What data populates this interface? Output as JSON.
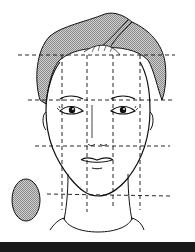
{
  "illustration": {
    "subject": "face proportion guide with turban",
    "colors": {
      "line": "#111111",
      "hatch": "#b5b5b5",
      "background": "#ffffff",
      "bottom_bar": "#1a1a1a"
    },
    "guides": {
      "horizontal_y": [
        55,
        100,
        146,
        194
      ],
      "vertical_x": [
        62,
        87,
        113,
        140
      ]
    },
    "swatch": "oval-gray"
  }
}
